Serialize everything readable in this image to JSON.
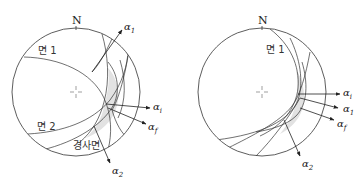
{
  "figure": {
    "left": {
      "north_label": "N",
      "planes": [
        {
          "label": "면 1"
        },
        {
          "label": "면 2"
        },
        {
          "label": "경사면"
        }
      ],
      "vectors": [
        {
          "symbol": "α",
          "subscript": "1"
        },
        {
          "symbol": "α",
          "subscript": "i"
        },
        {
          "symbol": "α",
          "subscript": "f"
        },
        {
          "symbol": "α",
          "subscript": "2"
        }
      ]
    },
    "right": {
      "north_label": "N",
      "planes": [
        {
          "label": "면 1"
        }
      ],
      "vectors": [
        {
          "symbol": "α",
          "subscript": "i"
        },
        {
          "symbol": "α",
          "subscript": "1"
        },
        {
          "symbol": "α",
          "subscript": "f"
        },
        {
          "symbol": "α",
          "subscript": "2"
        }
      ]
    }
  },
  "colors": {
    "line": "#333333",
    "shade": "#e2e2e2"
  }
}
